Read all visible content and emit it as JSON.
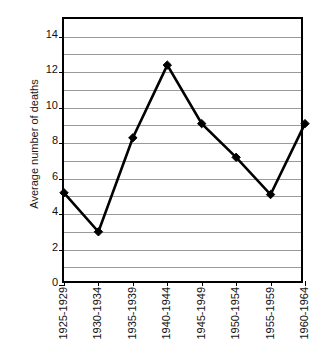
{
  "chart_data": {
    "type": "line",
    "title": "",
    "subtitle": "",
    "xlabel": "",
    "ylabel": "Average number of deaths",
    "categories": [
      "1925-1929",
      "1930-1934",
      "1935-1939",
      "1940-1944",
      "1945-1949",
      "1950-1954",
      "1955-1959",
      "1960-1964"
    ],
    "values": [
      5.2,
      3.0,
      8.3,
      12.4,
      9.1,
      7.2,
      5.1,
      9.1
    ],
    "series": [
      {
        "name": "Average number of deaths",
        "values": [
          5.2,
          3.0,
          8.3,
          12.4,
          9.1,
          7.2,
          5.1,
          9.1
        ]
      }
    ],
    "ylim": [
      0,
      15
    ],
    "xlim": [
      0,
      7
    ],
    "y_ticks": [
      0,
      2,
      4,
      6,
      8,
      10,
      12,
      14
    ],
    "y_tick_labels": [
      "0",
      "2",
      "4",
      "6",
      "8",
      "10",
      "12",
      "14"
    ],
    "y_gridlines": [
      1,
      2,
      3,
      4,
      5,
      6,
      7,
      8,
      9,
      10,
      11,
      12,
      13,
      14
    ],
    "grid": true,
    "grid_axis": "y",
    "legend": false,
    "legend_position": "none",
    "marker": "diamond",
    "line_color": "#000000",
    "marker_color": "#000000",
    "grid_color": "#9a9a9a",
    "axis_color": "#000000",
    "background": "#ffffff",
    "annotations": []
  }
}
